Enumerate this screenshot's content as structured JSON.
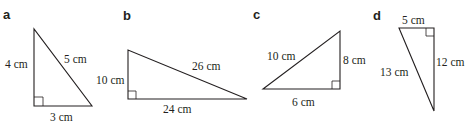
{
  "diagrams": [
    {
      "label": "a",
      "sides": {
        "vertical": "4 cm",
        "hypotenuse": "5 cm",
        "horizontal": "3 cm"
      },
      "right_angle": "bottom-left"
    },
    {
      "label": "b",
      "sides": {
        "vertical": "10 cm",
        "hypotenuse": "26 cm",
        "horizontal": "24 cm"
      },
      "right_angle": "bottom-left"
    },
    {
      "label": "c",
      "sides": {
        "hypotenuse": "10 cm",
        "vertical": "8 cm",
        "horizontal": "6 cm"
      },
      "right_angle": "bottom-right"
    },
    {
      "label": "d",
      "sides": {
        "horizontal": "5 cm",
        "vertical": "12 cm",
        "hypotenuse": "13 cm"
      },
      "right_angle": "top-right"
    }
  ],
  "colors": {
    "stroke": "#231f20",
    "background": "#ffffff"
  }
}
